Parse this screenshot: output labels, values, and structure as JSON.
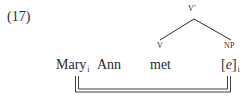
{
  "example_number": "(17)",
  "tree": {
    "root": "V′",
    "left_child": "V",
    "right_child": "NP"
  },
  "sentence": {
    "words": [
      {
        "text": "Mary",
        "index": "i"
      },
      {
        "text": "Ann",
        "index": ""
      },
      {
        "text": "met",
        "index": ""
      },
      {
        "text_open": "[",
        "text_italic": "e",
        "text_close": "]",
        "index": "i"
      }
    ]
  },
  "binding": {
    "from": "Mary",
    "to": "[e]",
    "style": "double-line",
    "color": "#2a2a2a"
  }
}
